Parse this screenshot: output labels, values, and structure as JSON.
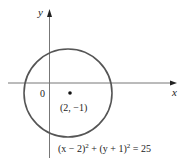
{
  "figure": {
    "type": "circle-graph",
    "axes": {
      "x_label": "x",
      "y_label": "y",
      "origin_label": "0"
    },
    "circle": {
      "center": [
        2,
        -1
      ],
      "radius": 5,
      "center_label": "(2, −1)",
      "equation_parts": {
        "left_open": "(x − 2)",
        "left_exp": "2",
        "plus": " + (y + 1)",
        "right_exp": "2",
        "equals": " = 25"
      },
      "stroke_color": "#555555"
    },
    "colors": {
      "axis": "#777777",
      "text": "#222222",
      "background": "#ffffff"
    }
  }
}
